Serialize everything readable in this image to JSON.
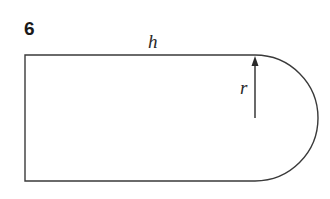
{
  "figure": {
    "question_number": "6",
    "shape_description": "Rectangle with a semicircle on its right side",
    "labels": {
      "length": "h",
      "radius": "r"
    },
    "colors": {
      "stroke": "#3a3a3a",
      "text": "#1a1a1a",
      "background": "#ffffff"
    }
  }
}
